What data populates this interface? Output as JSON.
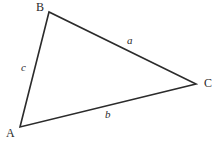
{
  "figure": {
    "type": "geometry-diagram",
    "shape": "triangle",
    "background_color": "#ffffff",
    "stroke_color": "#2b2b2b",
    "text_color": "#2b2b2b",
    "stroke_width": 1.6,
    "width": 223,
    "height": 147
  },
  "vertices": [
    {
      "id": "A",
      "label": "A",
      "x": 20,
      "y": 127,
      "label_x": 6,
      "label_y": 127
    },
    {
      "id": "B",
      "label": "B",
      "x": 49,
      "y": 12,
      "label_x": 36,
      "label_y": 1
    },
    {
      "id": "C",
      "label": "C",
      "x": 196,
      "y": 84,
      "label_x": 204,
      "label_y": 77
    }
  ],
  "sides": [
    {
      "id": "a",
      "label": "a",
      "from": "B",
      "to": "C",
      "label_x": 127,
      "label_y": 35
    },
    {
      "id": "b",
      "label": "b",
      "from": "A",
      "to": "C",
      "label_x": 105,
      "label_y": 109
    },
    {
      "id": "c",
      "label": "c",
      "from": "A",
      "to": "B",
      "label_x": 21,
      "label_y": 62
    }
  ],
  "chart_data": {
    "type": "scatter",
    "title": "",
    "xlabel": "",
    "ylabel": "",
    "points": [
      {
        "name": "A",
        "x": 20,
        "y": 127
      },
      {
        "name": "B",
        "x": 49,
        "y": 12
      },
      {
        "name": "C",
        "x": 196,
        "y": 84
      }
    ],
    "edges": [
      {
        "name": "c",
        "from": "A",
        "to": "B"
      },
      {
        "name": "a",
        "from": "B",
        "to": "C"
      },
      {
        "name": "b",
        "from": "A",
        "to": "C"
      }
    ],
    "annotations": [
      "A",
      "B",
      "C",
      "a",
      "b",
      "c"
    ],
    "xlim": [
      0,
      223
    ],
    "ylim": [
      0,
      147
    ],
    "grid": false,
    "legend": "none"
  }
}
